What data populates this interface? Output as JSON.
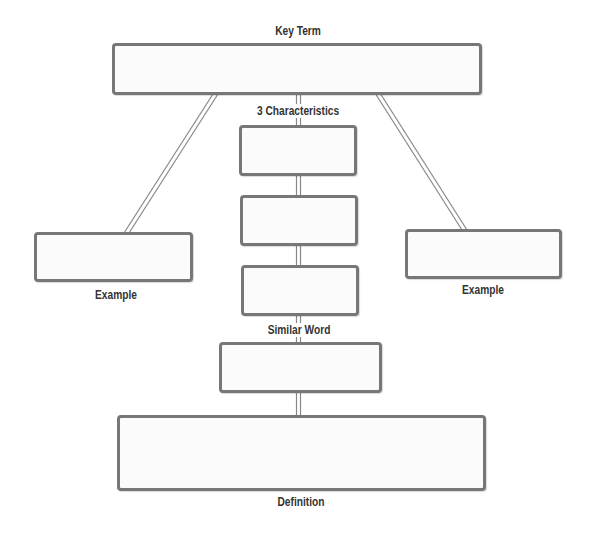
{
  "diagram": {
    "title": "Key Term",
    "labels": {
      "key_term": "Key Term",
      "characteristics": "3 Characteristics",
      "example_left": "Example",
      "example_right": "Example",
      "similar_word": "Similar Word",
      "definition": "Definition"
    },
    "colors": {
      "box_border": "#777777",
      "box_fill": "#fbfbfb",
      "connector": "#777777",
      "label_text": "#333333"
    },
    "nodes": [
      {
        "id": "key-term",
        "label": "Key Term",
        "value": ""
      },
      {
        "id": "characteristic-1",
        "label": "3 Characteristics",
        "value": ""
      },
      {
        "id": "characteristic-2",
        "label": "",
        "value": ""
      },
      {
        "id": "characteristic-3",
        "label": "",
        "value": ""
      },
      {
        "id": "example-left",
        "label": "Example",
        "value": ""
      },
      {
        "id": "example-right",
        "label": "Example",
        "value": ""
      },
      {
        "id": "similar-word",
        "label": "Similar Word",
        "value": ""
      },
      {
        "id": "definition",
        "label": "Definition",
        "value": ""
      }
    ],
    "edges": [
      {
        "from": "key-term",
        "to": "example-left"
      },
      {
        "from": "key-term",
        "to": "example-right"
      },
      {
        "from": "key-term",
        "to": "characteristic-1"
      },
      {
        "from": "characteristic-1",
        "to": "characteristic-2"
      },
      {
        "from": "characteristic-2",
        "to": "characteristic-3"
      },
      {
        "from": "characteristic-3",
        "to": "similar-word"
      },
      {
        "from": "similar-word",
        "to": "definition"
      }
    ]
  }
}
